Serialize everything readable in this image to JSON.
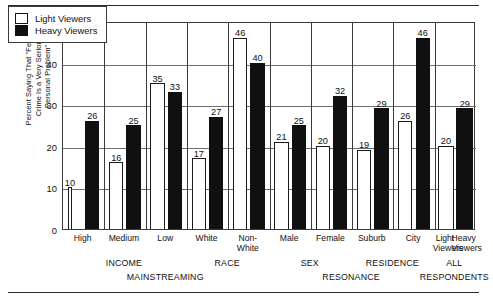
{
  "axis": {
    "ylabel": "Percent Saying That \"Fear of\nCrime Is a Very Serious\nPersonal Problem\"",
    "yticks": [
      "0",
      "10",
      "20",
      "30",
      "40",
      "50"
    ]
  },
  "legend": {
    "items": [
      {
        "key": "light",
        "label": "Light Viewers"
      },
      {
        "key": "heavy",
        "label": "Heavy Viewers"
      }
    ]
  },
  "groups_level1": [
    {
      "label": "INCOME"
    },
    {
      "label": "RACE"
    },
    {
      "label": "SEX"
    },
    {
      "label": "RESIDENCE"
    },
    {
      "label": "ALL"
    }
  ],
  "groups_level2": [
    {
      "label": "MAINSTREAMING"
    },
    {
      "label": "RESONANCE"
    },
    {
      "label": "RESPONDENTS"
    }
  ],
  "chart_data": {
    "type": "bar",
    "title": "",
    "xlabel": "",
    "ylabel": "Percent Saying That \"Fear of Crime Is a Very Serious Personal Problem\"",
    "ylim": [
      0,
      50
    ],
    "ytick_step": 10,
    "grid": true,
    "legend_position": "top-left-inside",
    "categories": [
      "High",
      "Medium",
      "Low",
      "White",
      "Non-\nWhite",
      "Male",
      "Female",
      "Suburb",
      "City",
      "Light\nViewers",
      "Heavy\nViewers"
    ],
    "series": [
      {
        "name": "Light Viewers",
        "values": [
          10,
          16,
          35,
          17,
          46,
          21,
          20,
          19,
          26,
          20,
          null
        ]
      },
      {
        "name": "Heavy Viewers",
        "values": [
          26,
          25,
          33,
          27,
          40,
          25,
          32,
          29,
          46,
          null,
          29
        ]
      }
    ],
    "bars": [
      {
        "category": "High",
        "group": "INCOME",
        "supergroup": "MAINSTREAMING",
        "light": 10,
        "heavy": 26
      },
      {
        "category": "Medium",
        "group": "INCOME",
        "supergroup": "MAINSTREAMING",
        "light": 16,
        "heavy": 25
      },
      {
        "category": "Low",
        "group": "INCOME",
        "supergroup": "MAINSTREAMING",
        "light": 35,
        "heavy": 33
      },
      {
        "category": "White",
        "group": "RACE",
        "supergroup": "MAINSTREAMING",
        "light": 17,
        "heavy": 27
      },
      {
        "category": "Non-White",
        "group": "RACE",
        "supergroup": "MAINSTREAMING",
        "light": 46,
        "heavy": 40
      },
      {
        "category": "Male",
        "group": "SEX",
        "supergroup": "RESONANCE",
        "light": 21,
        "heavy": 25
      },
      {
        "category": "Female",
        "group": "SEX",
        "supergroup": "RESONANCE",
        "light": 20,
        "heavy": 32
      },
      {
        "category": "Suburb",
        "group": "RESIDENCE",
        "supergroup": "RESONANCE",
        "light": 19,
        "heavy": 29
      },
      {
        "category": "City",
        "group": "RESIDENCE",
        "supergroup": "RESONANCE",
        "light": 26,
        "heavy": 46
      },
      {
        "category": "All Respondents",
        "group": "ALL",
        "supergroup": "RESPONDENTS",
        "light": 20,
        "heavy": 29
      }
    ]
  }
}
